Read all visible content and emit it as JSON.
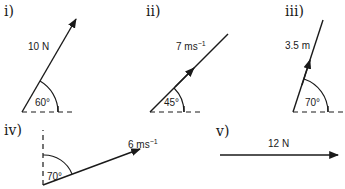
{
  "diagrams": [
    {
      "id": "i",
      "numeral": "i)",
      "magnitude": "10 N",
      "angle": "60°",
      "reference": "horizontal",
      "arrow_position": "tip"
    },
    {
      "id": "ii",
      "numeral": "ii)",
      "magnitude": "7 ms",
      "unit_exp": "−1",
      "angle": "45°",
      "reference": "horizontal",
      "arrow_position": "mid"
    },
    {
      "id": "iii",
      "numeral": "iii)",
      "magnitude": "3.5 m",
      "angle": "70°",
      "reference": "horizontal",
      "arrow_position": "mid"
    },
    {
      "id": "iv",
      "numeral": "iv)",
      "magnitude": "6 ms",
      "unit_exp": "−1",
      "angle": "70°",
      "reference": "vertical",
      "arrow_position": "tip"
    },
    {
      "id": "v",
      "numeral": "v)",
      "magnitude": "12 N",
      "angle": "",
      "reference": "none",
      "arrow_position": "tip"
    }
  ],
  "colors": {
    "ink": "#1a1a1a",
    "background": "#ffffff"
  }
}
